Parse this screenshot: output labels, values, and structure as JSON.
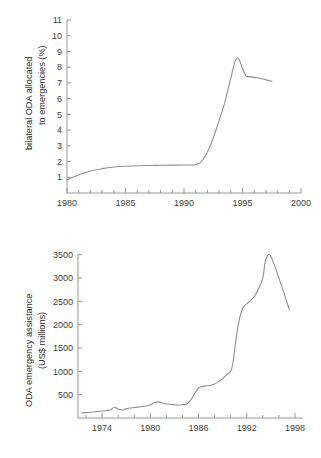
{
  "page": {
    "background_color": "#ffffff",
    "line_color": "#8f8f8f",
    "axis_color": "#8c8c8c",
    "text_color": "#3d3d3d"
  },
  "chart_data": [
    {
      "id": "top",
      "type": "line",
      "title": "",
      "subtitle": "",
      "xlabel": "",
      "ylabel": "bilateral ODA allocated to emergencies (%)",
      "ylabel_line1": "bilateral ODA allocated",
      "ylabel_line2": "to emergencies (%)",
      "xlim": [
        1980,
        2000
      ],
      "ylim": [
        0,
        11
      ],
      "grid": false,
      "legend": "none",
      "xticks": [
        1980,
        1985,
        1990,
        1995,
        2000
      ],
      "xtick_labels": [
        "1980",
        "1985",
        "1990",
        "1995",
        "2000"
      ],
      "xminor_ticks": [
        1981,
        1982,
        1983,
        1984,
        1986,
        1987,
        1988,
        1989,
        1991,
        1992,
        1993,
        1994,
        1996,
        1997,
        1998,
        1999
      ],
      "yticks": [
        1,
        2,
        3,
        4,
        5,
        6,
        7,
        8,
        9,
        10,
        11
      ],
      "ytick_labels": [
        "1",
        "2",
        "3",
        "4",
        "5",
        "6",
        "7",
        "8",
        "9",
        "10",
        "11"
      ],
      "x": [
        1980,
        1980.5,
        1981,
        1982,
        1983,
        1984,
        1985,
        1986,
        1987,
        1988,
        1989,
        1990,
        1990.5,
        1991,
        1991.5,
        1992,
        1992.5,
        1993,
        1993.5,
        1994,
        1994.4,
        1994.7,
        1995,
        1995.3,
        1995.6,
        1996,
        1996.5,
        1997,
        1997.5
      ],
      "y": [
        0.85,
        1.0,
        1.15,
        1.4,
        1.55,
        1.65,
        1.7,
        1.73,
        1.75,
        1.76,
        1.77,
        1.78,
        1.78,
        1.8,
        2.0,
        2.6,
        3.5,
        4.6,
        5.8,
        7.3,
        8.45,
        8.5,
        7.9,
        7.45,
        7.4,
        7.35,
        7.3,
        7.2,
        7.1
      ]
    },
    {
      "id": "bottom",
      "type": "line",
      "title": "",
      "subtitle": "",
      "xlabel": "",
      "ylabel": "ODA emergency assistance (US$ millions)",
      "ylabel_line1": "ODA emergency assistance",
      "ylabel_line2": "(US$ millions)",
      "xlim": [
        1971,
        1999
      ],
      "ylim": [
        0,
        3750
      ],
      "grid": false,
      "legend": "none",
      "xticks": [
        1974,
        1980,
        1986,
        1992,
        1998
      ],
      "xtick_labels": [
        "1974",
        "1980",
        "1986",
        "1992",
        "1998"
      ],
      "xminor_ticks": [
        1972,
        1976,
        1978,
        1982,
        1984,
        1988,
        1990,
        1994,
        1996
      ],
      "yticks": [
        500,
        1000,
        1500,
        2000,
        2500,
        3000,
        3500
      ],
      "ytick_labels": [
        "500",
        "1000",
        "1500",
        "2000",
        "2500",
        "3000",
        "3500"
      ],
      "x": [
        1971.5,
        1972,
        1973,
        1974,
        1975,
        1975.5,
        1976,
        1976.5,
        1977,
        1978,
        1979,
        1980,
        1980.5,
        1981,
        1981.5,
        1982,
        1983,
        1983.5,
        1984,
        1984.5,
        1985,
        1985.5,
        1986,
        1986.5,
        1987,
        1987.5,
        1988,
        1988.5,
        1989,
        1989.5,
        1990,
        1990.3,
        1990.6,
        1991,
        1991.5,
        1992,
        1992.5,
        1993,
        1993.5,
        1994,
        1994.3,
        1994.7,
        1995,
        1995.5,
        1996,
        1996.5,
        1997,
        1997.3
      ],
      "y": [
        110,
        115,
        130,
        150,
        170,
        230,
        190,
        170,
        200,
        225,
        245,
        280,
        330,
        345,
        320,
        300,
        285,
        280,
        285,
        300,
        380,
        520,
        640,
        680,
        690,
        700,
        730,
        780,
        840,
        930,
        1000,
        1200,
        1600,
        2050,
        2350,
        2450,
        2520,
        2620,
        2780,
        3000,
        3350,
        3500,
        3460,
        3250,
        3000,
        2750,
        2480,
        2320
      ]
    }
  ]
}
